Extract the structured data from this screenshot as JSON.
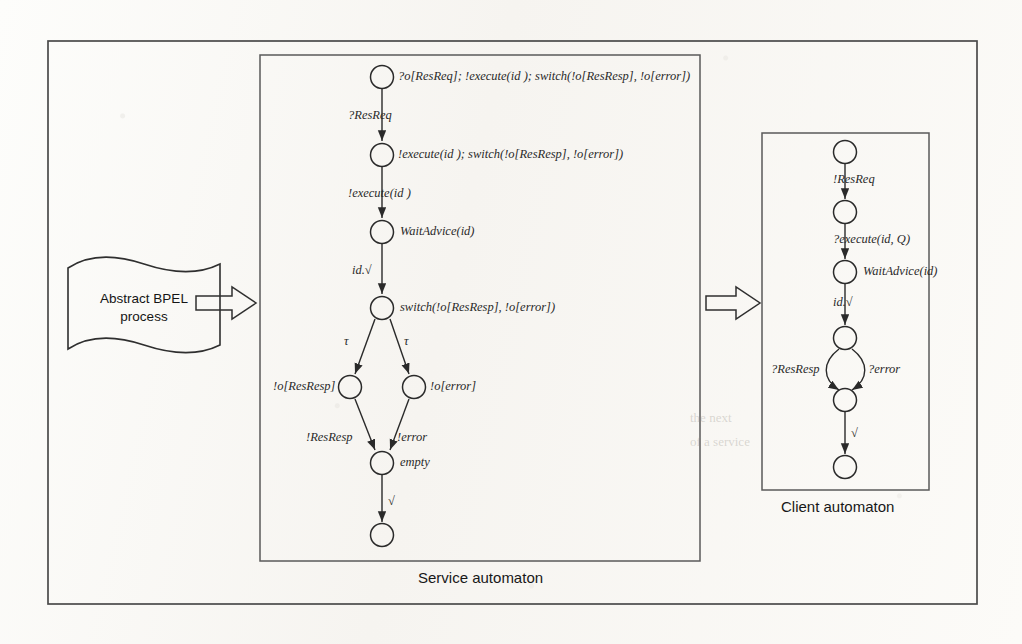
{
  "figure": {
    "source_banner": {
      "text": "Abstract BPEL\nprocess",
      "shape": "wavy-document"
    },
    "arrows": [
      {
        "name": "arrow-bpel-to-service"
      },
      {
        "name": "arrow-service-to-client"
      }
    ],
    "panels": [
      {
        "id": "service",
        "caption": "Service automaton",
        "states": [
          {
            "id": "s0",
            "label": "?o[ResReq]; !execute(id );   switch(!o[ResResp], !o[error])",
            "cx": 382,
            "cy": 77
          },
          {
            "id": "s1",
            "label": "!execute(id );   switch(!o[ResResp], !o[error])",
            "cx": 382,
            "cy": 155
          },
          {
            "id": "s2",
            "label": "WaitAdvice(id)",
            "cx": 382,
            "cy": 232
          },
          {
            "id": "s3",
            "label": "switch(!o[ResResp], !o[error])",
            "cx": 382,
            "cy": 308
          },
          {
            "id": "s4",
            "label": "!o[ResResp]",
            "cx": 350,
            "cy": 387,
            "label_side": "left"
          },
          {
            "id": "s5",
            "label": "!o[error]",
            "cx": 414,
            "cy": 387
          },
          {
            "id": "s6",
            "label": "empty",
            "cx": 382,
            "cy": 463
          },
          {
            "id": "s7",
            "label": "",
            "cx": 382,
            "cy": 535
          }
        ],
        "transitions": [
          {
            "from": "s0",
            "to": "s1",
            "label": "?ResReq"
          },
          {
            "from": "s1",
            "to": "s2",
            "label": "!execute(id )"
          },
          {
            "from": "s2",
            "to": "s3",
            "label": "id.√"
          },
          {
            "from": "s3",
            "to": "s4",
            "label": "τ"
          },
          {
            "from": "s3",
            "to": "s5",
            "label": "τ"
          },
          {
            "from": "s4",
            "to": "s6",
            "label": "!ResResp"
          },
          {
            "from": "s5",
            "to": "s6",
            "label": "!error"
          },
          {
            "from": "s6",
            "to": "s7",
            "label": "√"
          }
        ]
      },
      {
        "id": "client",
        "caption": "Client automaton",
        "states": [
          {
            "id": "c0",
            "label": "",
            "cx": 845,
            "cy": 152
          },
          {
            "id": "c1",
            "label": "",
            "cx": 845,
            "cy": 212
          },
          {
            "id": "c2",
            "label": "WaitAdvice(id)",
            "cx": 845,
            "cy": 272
          },
          {
            "id": "c3",
            "label": "",
            "cx": 845,
            "cy": 338
          },
          {
            "id": "c4",
            "label": "",
            "cx": 845,
            "cy": 400
          },
          {
            "id": "c5",
            "label": "",
            "cx": 845,
            "cy": 467
          }
        ],
        "transitions": [
          {
            "from": "c0",
            "to": "c1",
            "label": "!ResReq"
          },
          {
            "from": "c1",
            "to": "c2",
            "label": "?execute(id, Q)"
          },
          {
            "from": "c2",
            "to": "c3",
            "label": "id.√"
          },
          {
            "from": "c3",
            "to": "c4",
            "label": "?ResResp",
            "curve": "left"
          },
          {
            "from": "c3",
            "to": "c4",
            "label": "?error",
            "curve": "right"
          },
          {
            "from": "c4",
            "to": "c5",
            "label": "√"
          }
        ]
      }
    ],
    "background_bleed": [
      {
        "text": "the next",
        "x": 690,
        "y": 420
      },
      {
        "text": "of a service",
        "x": 690,
        "y": 444
      }
    ],
    "colors": {
      "ink": "#2a2a2a",
      "frame": "#4a4a4a",
      "paper": "#fbfaf8",
      "caption": "#181818"
    }
  }
}
